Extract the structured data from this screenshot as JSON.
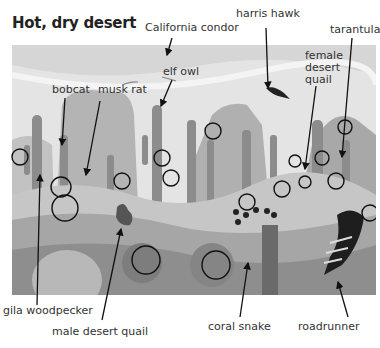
{
  "title": "Hot, dry desert",
  "labels": {
    "california_condor": "California condor",
    "harris_hawk": "harris hawk",
    "tarantula": "tarantula",
    "female_desert_quail": "female\ndesert\nquail",
    "bobcat": "bobcat",
    "musk_rat": "musk rat",
    "elf_owl": "elf owl",
    "gila_woodpecker": "gila woodpecker",
    "male_desert_quail": "male desert quail",
    "coral_snake": "coral snake",
    "roadrunner": "roadrunner"
  },
  "colors": {
    "sky": "#e6e6e6",
    "mountain": "#b8b8b8",
    "cactus": "#8f8f8f",
    "ground": "#c4c4c4",
    "foreground": "#9a9a9a",
    "circle": "#111111",
    "arrow": "#111111"
  }
}
